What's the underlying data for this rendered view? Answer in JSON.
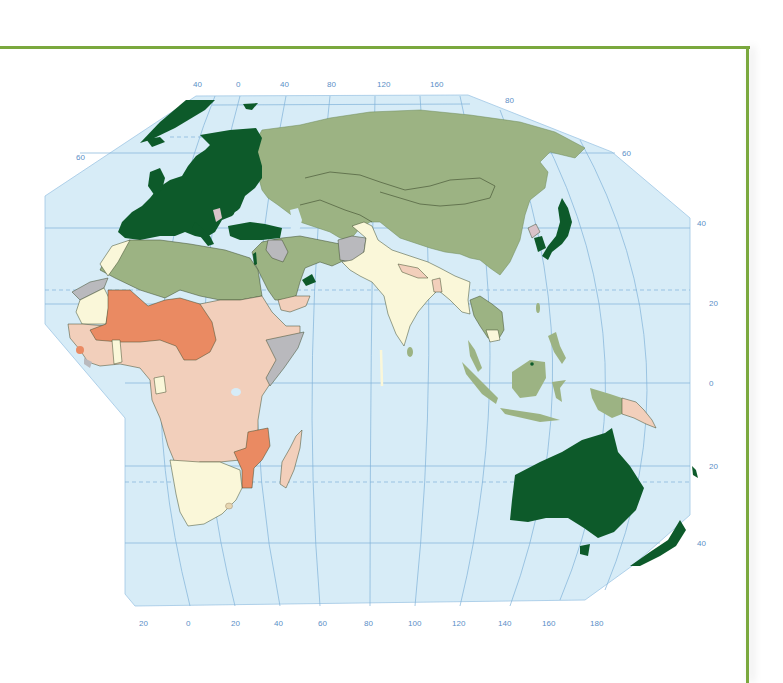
{
  "map": {
    "projection": "Eastern Hemisphere (Europe, Africa, Asia, Oceania)",
    "colors": {
      "ocean": "#d7ecf7",
      "frame": "#7aa83e",
      "graticule": "#7fb2d9",
      "label": "#5b8fc7",
      "dark_green": "#0d5a2a",
      "olive_green": "#9cb383",
      "pale_yellow": "#faf7d9",
      "peach": "#f2cfbb",
      "orange": "#ea8a62",
      "grey": "#b9b9bd",
      "pink_grey": "#d9c3c9"
    },
    "top_longitude_labels": [
      "40",
      "0",
      "40",
      "80",
      "120",
      "160"
    ],
    "top_right_latitude_label": "80",
    "left_latitude_labels": [
      "60"
    ],
    "right_latitude_labels": [
      "60",
      "40",
      "20",
      "0",
      "20",
      "40"
    ],
    "bottom_longitude_labels": [
      "20",
      "0",
      "20",
      "40",
      "60",
      "80",
      "100",
      "120",
      "140",
      "160",
      "180"
    ],
    "legend_categories": [
      {
        "key": "dark_green",
        "regions": [
          "Europe",
          "Turkey",
          "Israel",
          "UAE",
          "Japan",
          "South Korea",
          "Australia",
          "New Zealand",
          "Greenland",
          "Brunei"
        ]
      },
      {
        "key": "olive_green",
        "regions": [
          "Russia",
          "China",
          "Mongolia",
          "Kazakhstan",
          "Central Asia",
          "Iran",
          "Saudi Arabia",
          "North Africa",
          "Southeast Asia",
          "Indonesia",
          "Papua (Indonesia)"
        ]
      },
      {
        "key": "pale_yellow",
        "regions": [
          "India",
          "Pakistan",
          "Bangladesh",
          "Myanmar",
          "Cambodia",
          "Kyrgyzstan",
          "Western Sahara region",
          "Ghana",
          "Gabon",
          "Southern Africa",
          "Morocco"
        ]
      },
      {
        "key": "peach",
        "regions": [
          "Sub-Saharan Africa",
          "Yemen",
          "Nepal",
          "Papua New Guinea",
          "Madagascar"
        ]
      },
      {
        "key": "orange",
        "regions": [
          "Mali",
          "Niger",
          "Chad",
          "Burkina Faso",
          "Senegal",
          "Central African Republic",
          "Sierra Leone",
          "Mozambique"
        ]
      },
      {
        "key": "grey",
        "regions": [
          "Afghanistan",
          "Iraq",
          "Somalia",
          "Mauritania",
          "Liberia"
        ]
      },
      {
        "key": "pink_grey",
        "regions": [
          "North Korea",
          "Serbia"
        ]
      }
    ]
  }
}
